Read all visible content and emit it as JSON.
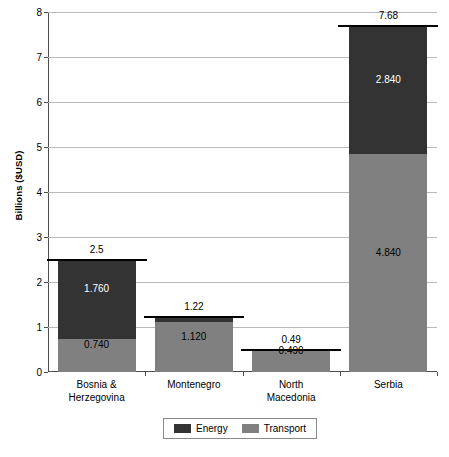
{
  "chart_data": {
    "type": "bar",
    "subtype": "stacked-bar",
    "title": "",
    "xlabel": "",
    "ylabel": "Billions ($USD)",
    "ylim": [
      0,
      8
    ],
    "ytick_values": [
      0,
      1,
      2,
      3,
      4,
      5,
      6,
      7,
      8
    ],
    "ytick_labels": [
      "0",
      "1",
      "2",
      "3",
      "4",
      "5",
      "6",
      "7",
      "8"
    ],
    "grid": true,
    "grid_axis": "y",
    "legend_position": "bottom",
    "categories": [
      "Bosnia & Herzegovina",
      "Montenegro",
      "North Macedonia",
      "Serbia"
    ],
    "category_label_lines": [
      [
        "Bosnia &",
        "Herzegovina"
      ],
      [
        "Montenegro"
      ],
      [
        "North",
        "Macedonia"
      ],
      [
        "Serbia"
      ]
    ],
    "series": [
      {
        "name": "Transport",
        "color": "#808080",
        "values": [
          0.74,
          1.12,
          0.49,
          4.84
        ],
        "labels": [
          "0.740",
          "1.120",
          "0.490",
          "4.840"
        ]
      },
      {
        "name": "Energy",
        "color": "#333333",
        "values": [
          1.76,
          0.1,
          0.0,
          2.84
        ],
        "labels": [
          "1.760",
          "",
          "",
          "2.840"
        ]
      }
    ],
    "totals": [
      2.5,
      1.22,
      0.49,
      7.68
    ],
    "total_labels": [
      "2.5",
      "1.22",
      "0.49",
      "7.68"
    ]
  },
  "legend": {
    "items": [
      {
        "label": "Energy",
        "color": "#333333",
        "swatch": "energy-swatch"
      },
      {
        "label": "Transport",
        "color": "#808080",
        "swatch": "transport-swatch"
      }
    ]
  },
  "colors": {
    "energy": "#333333",
    "transport": "#808080",
    "gridline": "#b9b9b9",
    "axis": "#4d4d4d",
    "background": "#ffffff"
  }
}
